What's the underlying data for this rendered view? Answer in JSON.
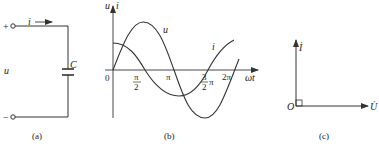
{
  "panels": {
    "a": {
      "caption": "(a)",
      "terminal_plus": "+",
      "terminal_minus": "−",
      "voltage_label": "u",
      "current_label": "i",
      "capacitor_label": "C"
    },
    "b": {
      "caption": "(b)",
      "y_axis_label_u": "u",
      "y_axis_label_sep": ",",
      "y_axis_label_i": "i",
      "x_axis_label": "ωt",
      "origin_label": "0",
      "tick_pi_over_2_num": "π",
      "tick_pi_over_2_den": "2",
      "tick_pi": "π",
      "tick_3pi_over_2_num": "3",
      "tick_3pi_over_2_den": "2",
      "tick_3pi_over_2_suffix": "π",
      "tick_2pi": "2π",
      "curve_u_label": "u",
      "curve_i_label": "i"
    },
    "c": {
      "caption": "(c)",
      "origin_label": "O",
      "phasor_i_label": "İ",
      "phasor_u_label": "U̇"
    }
  },
  "colors": {
    "stroke": "#333333",
    "text": "#222222"
  }
}
